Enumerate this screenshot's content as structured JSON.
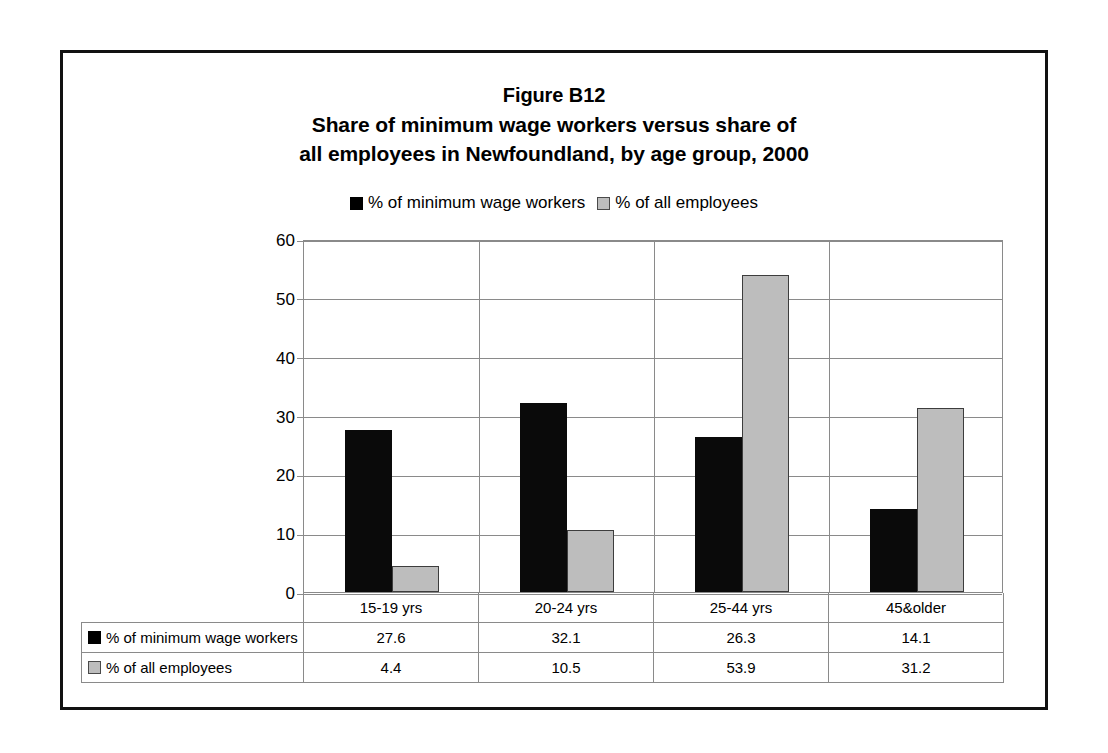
{
  "figure": {
    "title_lines": [
      "Figure B12",
      "Share of minimum wage workers versus share of",
      "all employees in Newfoundland, by age group, 2000"
    ]
  },
  "legend": {
    "entries": [
      {
        "label": "% of minimum wage workers",
        "swatch": "black",
        "color": "#000000"
      },
      {
        "label": "% of all employees",
        "swatch": "gray",
        "color": "#bdbdbd"
      }
    ]
  },
  "axis": {
    "y_ticks": [
      "0",
      "10",
      "20",
      "30",
      "40",
      "50",
      "60"
    ]
  },
  "table": {
    "row_header_blank": "",
    "categories": [
      "15-19 yrs",
      "20-24 yrs",
      "25-44 yrs",
      "45&older"
    ],
    "rows": [
      {
        "label": "% of minimum wage workers",
        "swatch": "black",
        "values": [
          "27.6",
          "32.1",
          "26.3",
          "14.1"
        ]
      },
      {
        "label": "% of all employees",
        "swatch": "gray",
        "values": [
          "4.4",
          "10.5",
          "53.9",
          "31.2"
        ]
      }
    ]
  },
  "chart_data": {
    "type": "bar",
    "xlabel": "",
    "ylabel": "",
    "ylim": [
      0,
      60
    ],
    "yticks": [
      0,
      10,
      20,
      30,
      40,
      50,
      60
    ],
    "grid": true,
    "legend_position": "top",
    "categories": [
      "15-19 yrs",
      "20-24 yrs",
      "25-44 yrs",
      "45&older"
    ],
    "series": [
      {
        "name": "% of minimum wage workers",
        "color": "#000000",
        "values": [
          27.6,
          32.1,
          26.3,
          14.1
        ]
      },
      {
        "name": "% of all employees",
        "color": "#bdbdbd",
        "values": [
          4.4,
          10.5,
          53.9,
          31.2
        ]
      }
    ]
  }
}
